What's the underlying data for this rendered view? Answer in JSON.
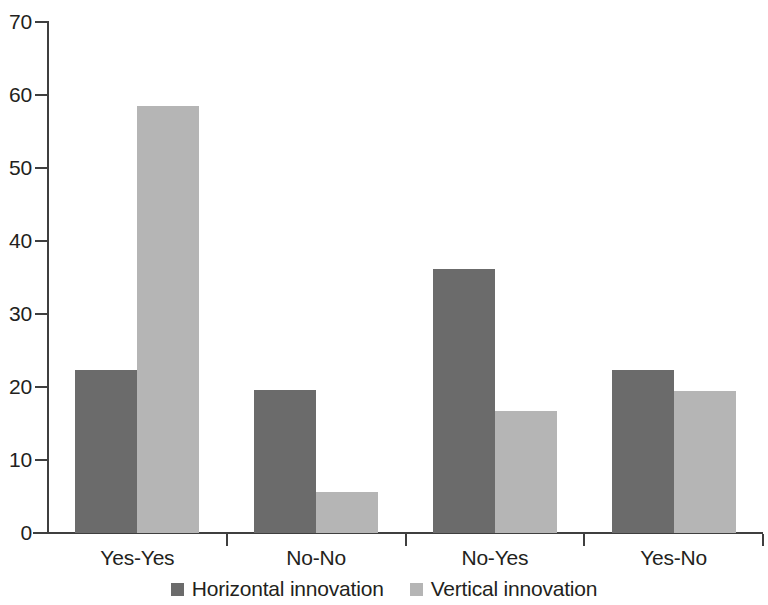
{
  "chart_data": {
    "type": "bar",
    "title": "",
    "subtitle": "",
    "xlabel": "",
    "ylabel": "",
    "categories": [
      "Yes-Yes",
      "No-No",
      "No-Yes",
      "Yes-No"
    ],
    "series": [
      {
        "name": "Horizontal innovation",
        "color": "#6b6b6b",
        "values": [
          22.3,
          19.6,
          36.1,
          22.3
        ]
      },
      {
        "name": "Vertical innovation",
        "color": "#b5b5b5",
        "values": [
          58.5,
          5.6,
          16.7,
          19.5
        ]
      }
    ],
    "ylim": [
      0,
      70
    ],
    "yticks": [
      0,
      10,
      20,
      30,
      40,
      50,
      60,
      70
    ],
    "ytick_labels": [
      "0",
      "10",
      "20",
      "30",
      "40",
      "50",
      "60",
      "70"
    ],
    "grid": false,
    "legend_position": "bottom-center",
    "bar_gap_within_group": 0,
    "orientation": "vertical"
  },
  "axis": {
    "y_axis_name": "y-axis",
    "x_axis_name": "x-axis"
  },
  "legend": {
    "entries": [
      {
        "label": "Horizontal innovation",
        "swatch": "dark-gray-swatch"
      },
      {
        "label": "Vertical innovation",
        "swatch": "light-gray-swatch"
      }
    ]
  }
}
